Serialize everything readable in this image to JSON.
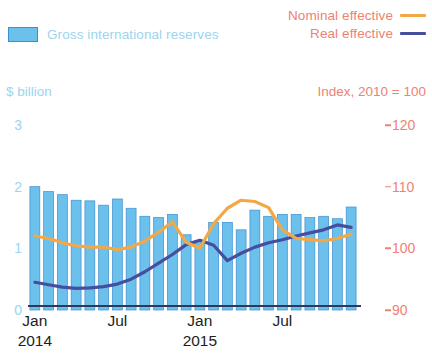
{
  "legend": {
    "bars_label": "Gross international reserves",
    "nominal_label": "Nominal effective",
    "real_label": "Real effective"
  },
  "axes": {
    "left_title": "$ billion",
    "right_title": "Index, 2010 = 100",
    "left_ticks": [
      "3",
      "2",
      "1",
      "0"
    ],
    "right_ticks": [
      "120",
      "110",
      "100",
      "90"
    ],
    "x_labels": [
      {
        "month": "Jan",
        "year": "2014"
      },
      {
        "month": "Jul",
        "year": ""
      },
      {
        "month": "Jan",
        "year": "2015"
      },
      {
        "month": "Jul",
        "year": ""
      }
    ]
  },
  "colors": {
    "bar_fill": "#6BC0EC",
    "bar_edge": "#3E8FD0",
    "nominal": "#F3A847",
    "real": "#464E9E",
    "left_axis_text": "#9BD5F0",
    "right_axis_text": "#EE8273",
    "axis_line": "#2b3a5c"
  },
  "chart_data": {
    "type": "bar",
    "title": "",
    "xlabel": "",
    "grid": false,
    "legend_position": "top",
    "categories": [
      "Jan 2014",
      "Feb 2014",
      "Mar 2014",
      "Apr 2014",
      "May 2014",
      "Jun 2014",
      "Jul 2014",
      "Aug 2014",
      "Sep 2014",
      "Oct 2014",
      "Nov 2014",
      "Dec 2014",
      "Jan 2015",
      "Feb 2015",
      "Mar 2015",
      "Apr 2015",
      "May 2015",
      "Jun 2015",
      "Jul 2015",
      "Aug 2015",
      "Sep 2015",
      "Oct 2015",
      "Nov 2015",
      "Dec 2015"
    ],
    "left_axis": {
      "label": "$ billion",
      "ylim": [
        0,
        3
      ],
      "ticks": [
        0,
        1,
        2,
        3
      ]
    },
    "right_axis": {
      "label": "Index, 2010 = 100",
      "ylim": [
        90,
        120
      ],
      "ticks": [
        90,
        100,
        110,
        120
      ]
    },
    "series": [
      {
        "name": "Gross international reserves",
        "type": "bar",
        "axis": "left",
        "unit": "$ billion",
        "values": [
          2.0,
          1.92,
          1.87,
          1.78,
          1.77,
          1.7,
          1.8,
          1.65,
          1.52,
          1.5,
          1.55,
          1.22,
          1.13,
          1.42,
          1.42,
          1.3,
          1.62,
          1.52,
          1.55,
          1.55,
          1.5,
          1.52,
          1.48,
          1.67
        ]
      },
      {
        "name": "Nominal effective",
        "type": "line",
        "axis": "right",
        "unit": "Index, 2010 = 100",
        "values": [
          102.0,
          101.6,
          100.9,
          100.4,
          100.2,
          100.2,
          99.8,
          100.2,
          101.2,
          102.6,
          104.3,
          101.0,
          100.0,
          104.0,
          106.5,
          107.8,
          107.6,
          106.6,
          103.0,
          101.6,
          101.4,
          101.2,
          101.6,
          102.3
        ]
      },
      {
        "name": "Real effective",
        "type": "line",
        "axis": "right",
        "unit": "Index, 2010 = 100",
        "values": [
          94.5,
          94.1,
          93.7,
          93.5,
          93.6,
          93.8,
          94.2,
          95.0,
          96.2,
          97.6,
          99.0,
          100.6,
          101.3,
          100.5,
          98.0,
          99.2,
          100.2,
          100.9,
          101.4,
          102.0,
          102.5,
          103.0,
          103.8,
          103.4
        ]
      }
    ]
  }
}
